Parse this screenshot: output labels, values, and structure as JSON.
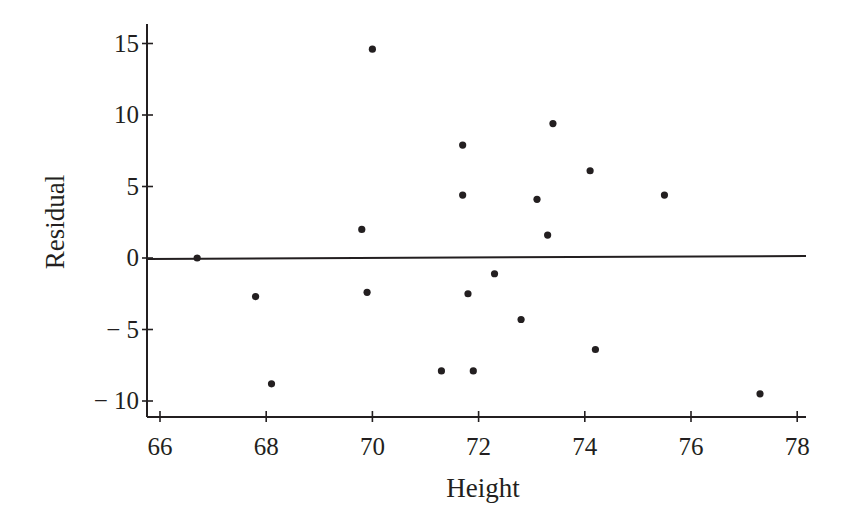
{
  "chart_data": {
    "type": "scatter",
    "title": "",
    "xlabel": "Height",
    "ylabel": "Residual",
    "xlim": [
      65.8,
      78.2
    ],
    "ylim": [
      -11.2,
      16.5
    ],
    "xticks": [
      66,
      68,
      70,
      72,
      74,
      76,
      78
    ],
    "yticks": [
      15,
      10,
      5,
      0,
      -5,
      -10
    ],
    "ytick_labels": [
      "15",
      "10",
      "5",
      "0",
      "− 5",
      "− 10"
    ],
    "xtick_labels": [
      "66",
      "68",
      "70",
      "72",
      "74",
      "76",
      "78"
    ],
    "grid": false,
    "legend": null,
    "reference_line": {
      "y": 0,
      "label": "zero residual line"
    },
    "series": [
      {
        "name": "Residuals",
        "points": [
          {
            "x": 66.7,
            "y": 0.0
          },
          {
            "x": 67.8,
            "y": -2.7
          },
          {
            "x": 68.1,
            "y": -8.8
          },
          {
            "x": 69.8,
            "y": 2.0
          },
          {
            "x": 69.9,
            "y": -2.4
          },
          {
            "x": 70.0,
            "y": 14.6
          },
          {
            "x": 71.3,
            "y": -7.9
          },
          {
            "x": 71.7,
            "y": 4.4
          },
          {
            "x": 71.7,
            "y": 7.9
          },
          {
            "x": 71.8,
            "y": -2.5
          },
          {
            "x": 71.9,
            "y": -7.9
          },
          {
            "x": 72.3,
            "y": -1.1
          },
          {
            "x": 72.8,
            "y": -4.3
          },
          {
            "x": 73.1,
            "y": 4.1
          },
          {
            "x": 73.3,
            "y": 1.6
          },
          {
            "x": 73.4,
            "y": 9.4
          },
          {
            "x": 74.1,
            "y": 6.1
          },
          {
            "x": 74.2,
            "y": -6.4
          },
          {
            "x": 75.5,
            "y": 4.4
          },
          {
            "x": 77.3,
            "y": -9.5
          }
        ]
      }
    ]
  }
}
